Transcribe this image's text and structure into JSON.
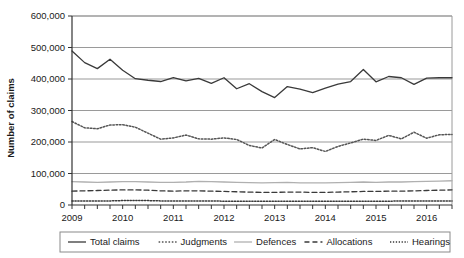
{
  "chart_data": {
    "type": "line",
    "title": "",
    "xlabel": "",
    "ylabel": "Number of claims",
    "ylim": [
      0,
      600000
    ],
    "ytick_step": 100000,
    "ytick_labels": [
      "0",
      "100,000",
      "200,000",
      "300,000",
      "400,000",
      "500,000",
      "600,000"
    ],
    "ytick_values": [
      0,
      100000,
      200000,
      300000,
      400000,
      500000,
      600000
    ],
    "xtick_labels": [
      "2009",
      "2010",
      "2011",
      "2012",
      "2013",
      "2014",
      "2015",
      "2016"
    ],
    "x_period": "quarterly",
    "x_count": 31,
    "grid": "horizontal",
    "legend_position": "bottom",
    "series": [
      {
        "name": "Total claims",
        "style": "solid",
        "color": "#3a3a3a",
        "values": [
          489000,
          452000,
          433000,
          463000,
          428000,
          401000,
          396000,
          392000,
          404000,
          394000,
          402000,
          386000,
          404000,
          369000,
          385000,
          360000,
          341000,
          376000,
          368000,
          357000,
          371000,
          384000,
          392000,
          430000,
          391000,
          408000,
          404000,
          383000,
          403000,
          404000,
          404000,
          440000,
          409000
        ]
      },
      {
        "name": "Judgments",
        "style": "dotted",
        "color": "#555555",
        "values": [
          265000,
          245000,
          242000,
          254000,
          255000,
          247000,
          228000,
          209000,
          213000,
          222000,
          210000,
          209000,
          213000,
          208000,
          189000,
          181000,
          208000,
          192000,
          178000,
          182000,
          170000,
          186000,
          197000,
          209000,
          205000,
          221000,
          210000,
          231000,
          212000,
          223000,
          224000,
          247000,
          226000
        ]
      },
      {
        "name": "Defences",
        "style": "solid",
        "color": "#b0b0b0",
        "values": [
          74000,
          73000,
          72000,
          73000,
          74000,
          74000,
          73000,
          72000,
          72000,
          73000,
          75000,
          74000,
          73000,
          72000,
          71000,
          70000,
          71000,
          72000,
          70000,
          70000,
          70000,
          71000,
          72000,
          73000,
          72000,
          73000,
          73000,
          74000,
          75000,
          76000,
          77000,
          79000,
          80000
        ]
      },
      {
        "name": "Allocations",
        "style": "dashed",
        "color": "#3a3a3a",
        "values": [
          44000,
          45000,
          46000,
          47000,
          48000,
          48000,
          47000,
          45000,
          44000,
          45000,
          45000,
          44000,
          43000,
          42000,
          41000,
          40000,
          40000,
          41000,
          41000,
          40000,
          40000,
          41000,
          42000,
          43000,
          43000,
          44000,
          44000,
          45000,
          46000,
          47000,
          48000,
          50000,
          51000
        ]
      },
      {
        "name": "Hearings",
        "style": "fine-dotted",
        "color": "#3a3a3a",
        "values": [
          13000,
          13000,
          13000,
          13000,
          14000,
          14000,
          14000,
          13000,
          13000,
          13000,
          13000,
          13000,
          12000,
          12000,
          12000,
          12000,
          12000,
          12000,
          12000,
          12000,
          12000,
          12000,
          12000,
          12000,
          12000,
          12000,
          13000,
          13000,
          13000,
          13000,
          13000,
          14000,
          14000
        ]
      }
    ]
  },
  "legend": {
    "items": [
      {
        "label": "Total claims"
      },
      {
        "label": "Judgments"
      },
      {
        "label": "Defences"
      },
      {
        "label": "Allocations"
      },
      {
        "label": "Hearings"
      }
    ]
  }
}
